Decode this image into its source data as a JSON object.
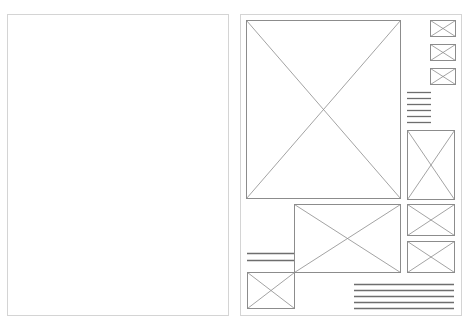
{
  "document": {
    "type": "wireframe-spread",
    "pages": [
      {
        "name": "left-page",
        "x": 7,
        "y": 14,
        "w": 222,
        "h": 302,
        "content": "blank"
      },
      {
        "name": "right-page",
        "x": 240,
        "y": 14,
        "w": 222,
        "h": 302,
        "content": "layout"
      }
    ]
  },
  "colors": {
    "page_border": "#d4d4d4",
    "placeholder_stroke": "#8c8c8c",
    "text_line": "#6e6e6e"
  },
  "image_placeholders": [
    {
      "id": "hero-image",
      "x": 246,
      "y": 20,
      "w": 154,
      "h": 178
    },
    {
      "id": "thumb-1",
      "x": 430,
      "y": 20,
      "w": 25,
      "h": 16
    },
    {
      "id": "thumb-2",
      "x": 430,
      "y": 44,
      "w": 25,
      "h": 16
    },
    {
      "id": "thumb-3",
      "x": 430,
      "y": 68,
      "w": 25,
      "h": 16
    },
    {
      "id": "side-tall-image",
      "x": 407,
      "y": 130,
      "w": 47,
      "h": 69
    },
    {
      "id": "middle-image",
      "x": 294,
      "y": 204,
      "w": 106,
      "h": 68
    },
    {
      "id": "side-image-a",
      "x": 407,
      "y": 204,
      "w": 47,
      "h": 31
    },
    {
      "id": "side-image-b",
      "x": 407,
      "y": 241,
      "w": 47,
      "h": 31
    },
    {
      "id": "bottom-left-image",
      "x": 247,
      "y": 272,
      "w": 47,
      "h": 36
    }
  ],
  "text_blocks": [
    {
      "id": "side-text",
      "x1": 407,
      "x2": 431,
      "ys": [
        92,
        98,
        104,
        110,
        116,
        122
      ]
    },
    {
      "id": "left-caption",
      "x1": 247,
      "x2": 294,
      "ys": [
        253,
        260
      ]
    },
    {
      "id": "bottom-text",
      "x1": 354,
      "x2": 454,
      "ys": [
        284,
        290,
        296,
        302,
        308
      ]
    }
  ]
}
